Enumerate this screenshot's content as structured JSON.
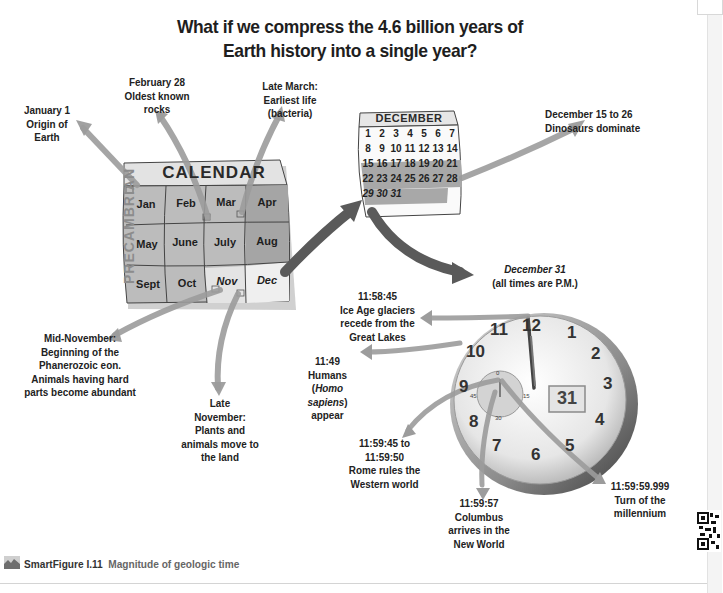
{
  "title": {
    "line1": "What if we compress the 4.6 billion years of",
    "line2": "Earth history into a single year?"
  },
  "calendar": {
    "header": "CALENDAR",
    "side_label": "PRECAMBRIAN",
    "months": [
      "Jan",
      "Feb",
      "Mar",
      "Apr",
      "May",
      "June",
      "July",
      "Aug",
      "Sept",
      "Oct",
      "Nov",
      "Dec"
    ]
  },
  "december": {
    "header": "DECEMBER",
    "days": [
      "1",
      "2",
      "3",
      "4",
      "5",
      "6",
      "7",
      "8",
      "9",
      "10",
      "11",
      "12",
      "13",
      "14",
      "15",
      "16",
      "17",
      "18",
      "19",
      "20",
      "21",
      "22",
      "23",
      "24",
      "25",
      "26",
      "27",
      "28",
      "29",
      "30",
      "31"
    ]
  },
  "callouts": {
    "jan1": [
      "January 1",
      "Origin of",
      "Earth"
    ],
    "feb28": [
      "February 28",
      "Oldest known",
      "rocks"
    ],
    "late_march": [
      "Late March:",
      "Earliest life",
      "(bacteria)"
    ],
    "dec15": [
      "December 15 to 26",
      "Dinosaurs dominate"
    ],
    "mid_nov": [
      "Mid-November:",
      "Beginning of the",
      "Phanerozoic eon.",
      "Animals having hard",
      "parts become abundant"
    ],
    "late_nov": [
      "Late",
      "November:",
      "Plants and",
      "animals move to",
      "the land"
    ],
    "dec31": {
      "line1": "December 31",
      "line2": "(all times are P.M.)"
    },
    "ice_age": [
      "11:58:45",
      "Ice Age glaciers",
      "recede from the",
      "Great Lakes"
    ],
    "humans": {
      "time": "11:49",
      "line2": "Humans",
      "open": "(",
      "italic": "Homo sapiens",
      "close": ")",
      "line4": "appear"
    },
    "rome": [
      "11:59:45 to",
      "11:59:50",
      "Rome rules the",
      "Western world"
    ],
    "columbus": [
      "11:59:57",
      "Columbus",
      "arrives in the",
      "New World"
    ],
    "millennium": [
      "11:59:59.999",
      "Turn of the",
      "millennium"
    ]
  },
  "clock": {
    "numbers": [
      "12",
      "1",
      "2",
      "3",
      "4",
      "5",
      "6",
      "7",
      "8",
      "9",
      "10",
      "11"
    ],
    "date_window": "31",
    "subdial": [
      "0",
      "15",
      "30",
      "45"
    ]
  },
  "caption": {
    "figure": "SmartFigure I.11",
    "description": "Magnitude of geologic time"
  },
  "colors": {
    "arrow": "#9a9a9a",
    "arrow_dark": "#555555",
    "calendar_cell": "#b9b9b9",
    "calendar_header": "#e2e2e2",
    "calendar_light": "#ededed",
    "text": "#1e1e1e"
  }
}
